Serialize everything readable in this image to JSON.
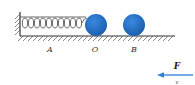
{
  "diagram": {
    "type": "physics-spring-mass",
    "colors": {
      "ball": "#1f6fc2",
      "line": "#333333",
      "arrow": "#2a7fd4",
      "hatch": "#555555"
    },
    "spring": {
      "coils": 10
    },
    "balls": [
      {
        "label": "O"
      },
      {
        "label": "B"
      }
    ],
    "labels": {
      "A": "A",
      "O": "O",
      "B": "B",
      "force": "F",
      "velocity": "v"
    },
    "force_arrow": {
      "direction": "left"
    }
  }
}
